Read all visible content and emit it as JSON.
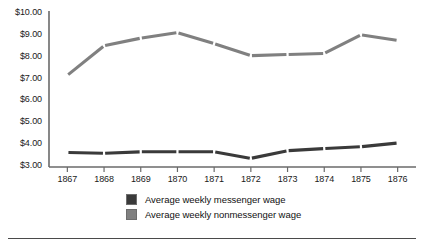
{
  "chart_data": {
    "type": "line",
    "title": "",
    "subtitle": "",
    "xlabel": "",
    "ylabel": "",
    "categories": [
      "1867",
      "1868",
      "1869",
      "1870",
      "1871",
      "1872",
      "1873",
      "1874",
      "1875",
      "1876"
    ],
    "x": [
      1867,
      1868,
      1869,
      1870,
      1871,
      1872,
      1873,
      1874,
      1875,
      1876
    ],
    "ylim": [
      3.0,
      10.0
    ],
    "ytick_values": [
      3.0,
      4.0,
      5.0,
      6.0,
      7.0,
      8.0,
      9.0,
      10.0
    ],
    "ytick_labels": [
      "$3.00",
      "$4.00",
      "$5.00",
      "$6.00",
      "$7.00",
      "$8.00",
      "$9.00",
      "$10.00"
    ],
    "grid": false,
    "legend_position": "bottom",
    "series": [
      {
        "name": "Average weekly messenger wage",
        "color": "#3a3a3a",
        "values": [
          3.62,
          3.58,
          3.65,
          3.65,
          3.65,
          3.35,
          3.7,
          3.8,
          3.88,
          4.05
        ]
      },
      {
        "name": "Average weekly nonmessenger wage",
        "color": "#808080",
        "values": [
          7.15,
          8.5,
          8.85,
          9.1,
          8.6,
          8.05,
          8.1,
          8.15,
          9.0,
          8.75
        ]
      }
    ]
  },
  "axes": {
    "y_axis_name": "y-axis",
    "x_axis_name": "x-axis"
  },
  "legend": {
    "items": [
      {
        "label": "Average weekly messenger wage",
        "color": "#3a3a3a"
      },
      {
        "label": "Average weekly nonmessenger wage",
        "color": "#808080"
      }
    ]
  },
  "colors": {
    "messenger": "#3a3a3a",
    "nonmessenger": "#808080",
    "axis": "#6a6a6a",
    "text": "#1a1a1a",
    "rule": "#4a4a4a"
  }
}
